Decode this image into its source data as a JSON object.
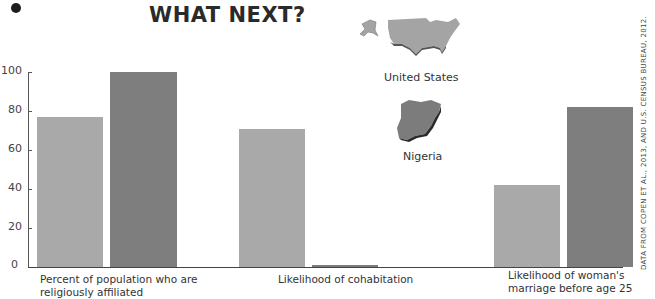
{
  "header": {
    "title": "WHAT NEXT?"
  },
  "legend": {
    "us_label": "United States",
    "nigeria_label": "Nigeria",
    "us_color": "#a9a9a9",
    "nigeria_color": "#7e7e7e"
  },
  "axis": {
    "ticks": [
      "0",
      "20",
      "40",
      "60",
      "80",
      "100"
    ]
  },
  "source": "DATA FROM COPEN ET AL., 2013, AND U.S. CENSUS BUREAU, 2012.",
  "chart_data": {
    "type": "bar",
    "title": "WHAT NEXT?",
    "xlabel": "",
    "ylabel": "",
    "ylim": [
      0,
      100
    ],
    "yticks": [
      0,
      20,
      40,
      60,
      80,
      100
    ],
    "grid": false,
    "legend_position": "top-center (map icons)",
    "categories": [
      "Percent of population who are religiously affiliated",
      "Likelihood of cohabitation",
      "Likelihood of woman's marriage before age 25"
    ],
    "series": [
      {
        "name": "United States",
        "values": [
          77,
          71,
          42
        ]
      },
      {
        "name": "Nigeria",
        "values": [
          100,
          1,
          82
        ]
      }
    ]
  }
}
